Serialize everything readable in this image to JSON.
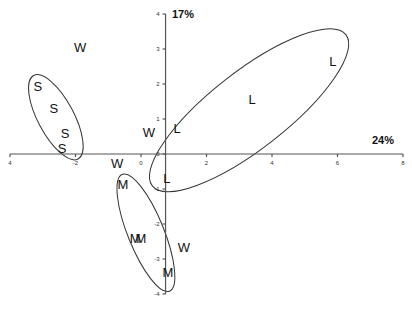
{
  "chart_data": {
    "type": "scatter",
    "title": "",
    "xlabel": "24%",
    "ylabel": "17%",
    "xlim": [
      -4,
      8
    ],
    "ylim": [
      -4,
      4
    ],
    "x_ticks": [
      -4,
      -2,
      0,
      2,
      4,
      6,
      8
    ],
    "x_tick_labels": [
      "4",
      "-2",
      "0",
      "2",
      "4",
      "6",
      "8"
    ],
    "y_ticks": [
      4,
      3,
      2,
      1,
      0,
      -1,
      -2,
      -3,
      -4
    ],
    "y_tick_labels": [
      "4",
      "3",
      "2",
      "1",
      "0",
      "-1",
      "-2",
      "-3",
      "-4"
    ],
    "y_axis_at_x": 0.75,
    "grid": false,
    "series": [
      {
        "name": "S",
        "points": [
          [
            -3.15,
            1.94
          ],
          [
            -2.66,
            1.31
          ],
          [
            -2.32,
            0.6
          ],
          [
            -2.41,
            0.17
          ]
        ]
      },
      {
        "name": "W",
        "points": [
          [
            -1.86,
            3.06
          ],
          [
            0.24,
            0.63
          ],
          [
            -0.73,
            -0.26
          ],
          [
            1.31,
            -2.66
          ]
        ]
      },
      {
        "name": "L",
        "points": [
          [
            1.1,
            0.74
          ],
          [
            0.79,
            -0.69
          ],
          [
            3.39,
            1.57
          ],
          [
            5.86,
            2.66
          ]
        ]
      },
      {
        "name": "M",
        "points": [
          [
            -0.55,
            -0.86
          ],
          [
            -0.18,
            -2.4
          ],
          [
            0.0,
            -2.4
          ],
          [
            0.82,
            -3.37
          ]
        ]
      }
    ],
    "ellipses": [
      {
        "group": "S",
        "cx": -2.6,
        "cy": 1.05,
        "rx": 0.55,
        "ry": 1.35,
        "angle_deg": -28
      },
      {
        "group": "L",
        "cx": 3.3,
        "cy": 1.25,
        "rx": 3.75,
        "ry": 1.1,
        "angle_deg": -38
      },
      {
        "group": "M",
        "cx": 0.15,
        "cy": -2.25,
        "rx": 0.55,
        "ry": 1.8,
        "angle_deg": -22
      }
    ]
  }
}
